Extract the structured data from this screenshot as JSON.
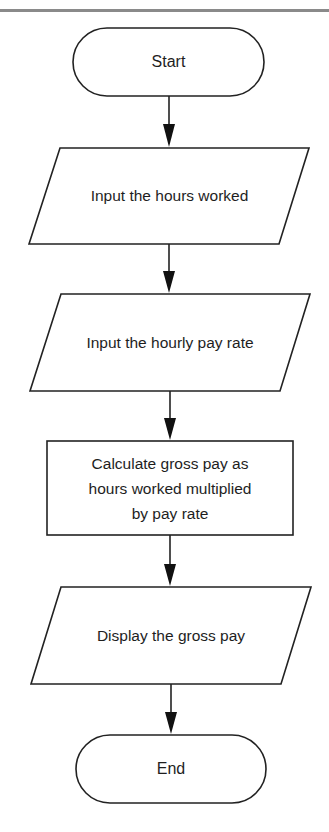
{
  "diagram": {
    "type": "flowchart",
    "stroke_color": "#222222",
    "text_color": "#1e1e1e",
    "nodes": [
      {
        "id": "start",
        "shape": "terminal",
        "label": "Start"
      },
      {
        "id": "input-hours",
        "shape": "parallelogram",
        "label": "Input the hours worked"
      },
      {
        "id": "input-rate",
        "shape": "parallelogram",
        "label": "Input the hourly pay rate"
      },
      {
        "id": "calculate",
        "shape": "process",
        "label": "Calculate gross pay as hours worked multiplied by pay rate",
        "lines": [
          "Calculate gross pay as",
          "hours worked multiplied",
          "by pay rate"
        ]
      },
      {
        "id": "display",
        "shape": "parallelogram",
        "label": "Display the gross pay"
      },
      {
        "id": "end",
        "shape": "terminal",
        "label": "End"
      }
    ],
    "edges": [
      {
        "from": "start",
        "to": "input-hours"
      },
      {
        "from": "input-hours",
        "to": "input-rate"
      },
      {
        "from": "input-rate",
        "to": "calculate"
      },
      {
        "from": "calculate",
        "to": "display"
      },
      {
        "from": "display",
        "to": "end"
      }
    ]
  }
}
